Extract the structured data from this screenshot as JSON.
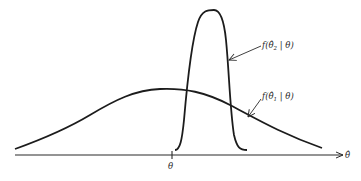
{
  "diagram": {
    "type": "probability-density-comparison",
    "axis": {
      "label": "θ̂",
      "tick_label": "θ"
    },
    "curves": [
      {
        "name": "wide-density",
        "label_prefix": "f(θ̂",
        "label_subscript": "1",
        "label_suffix": " | θ)",
        "description": "wide, low-peaked density"
      },
      {
        "name": "narrow-density",
        "label_prefix": "f(θ̂",
        "label_subscript": "2",
        "label_suffix": " | θ)",
        "description": "narrow, tall-peaked density shifted right of θ"
      }
    ],
    "colors": {
      "ink": "#1c1c1c",
      "background": "#ffffff"
    }
  }
}
